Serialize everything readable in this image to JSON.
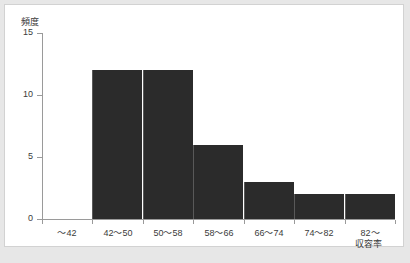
{
  "chart_data": {
    "type": "bar",
    "title": "",
    "subtitle": "",
    "xlabel": "収容率",
    "ylabel": "頻度",
    "categories": [
      "～42",
      "42～50",
      "50～58",
      "58～66",
      "66～74",
      "74～82",
      "82～"
    ],
    "values": [
      0,
      12,
      12,
      6,
      3,
      2,
      2
    ],
    "series": [
      {
        "name": "頻度",
        "values": [
          0,
          12,
          12,
          6,
          3,
          2,
          2
        ]
      }
    ],
    "ylim": [
      0,
      15
    ],
    "y_ticks": [
      0,
      5,
      10,
      15
    ],
    "y_tick_labels": [
      "0",
      "5",
      "10",
      "15"
    ],
    "grid": false,
    "legend": false,
    "legend_position": "none",
    "bar_color": "#2b2b2b",
    "axis_color": "#9a9a9a",
    "text_color": "#3b3b3b",
    "plot_background": "#ffffff",
    "page_background": "#e7e7e7",
    "annotations": []
  }
}
